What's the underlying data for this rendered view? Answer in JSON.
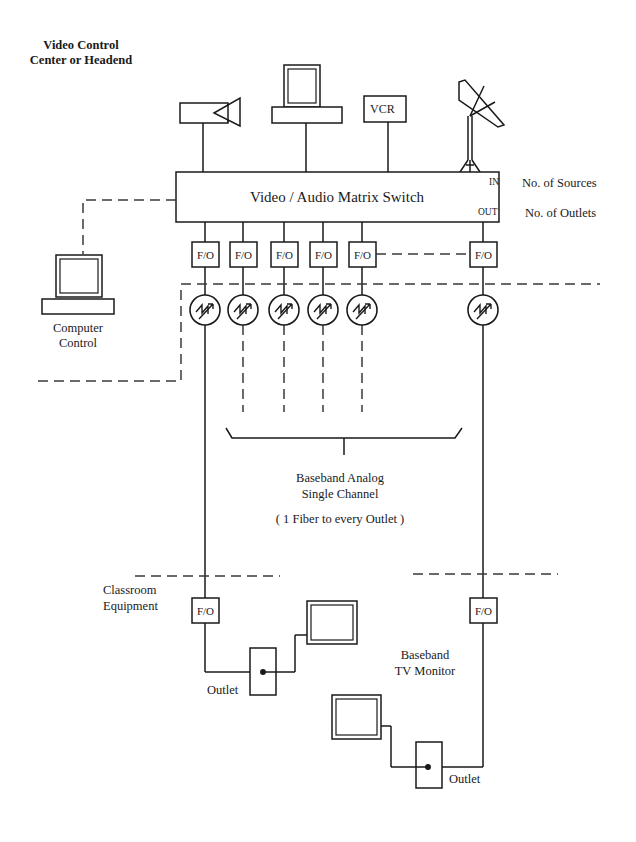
{
  "diagram": {
    "title_lines": [
      "Video Control",
      "Center or Headend"
    ],
    "switch": {
      "label": "Video / Audio Matrix Switch",
      "in_label": "IN",
      "out_label": "OUT",
      "in_note": "No. of Sources",
      "out_note": "No. of Outlets"
    },
    "sources": [
      {
        "name": "camera",
        "label": ""
      },
      {
        "name": "computer-terminal",
        "label": ""
      },
      {
        "name": "vcr",
        "label": "VCR"
      },
      {
        "name": "satellite-dish",
        "label": ""
      }
    ],
    "computer_control": {
      "lines": [
        "Computer",
        "Control"
      ]
    },
    "fo_label": "F/O",
    "fo_count": 6,
    "transmitter_count": 6,
    "baseband": {
      "lines": [
        "Baseband Analog",
        "Single Channel"
      ],
      "note": "( 1 Fiber to every Outlet )"
    },
    "classroom": {
      "lines": [
        "Classroom",
        "Equipment"
      ],
      "outlet_label": "Outlet"
    },
    "tv_monitor": {
      "lines": [
        "Baseband",
        "TV Monitor"
      ],
      "outlet_label": "Outlet"
    },
    "colors": {
      "line": "#1a1a1a",
      "dash": "#3a3a3a"
    }
  }
}
